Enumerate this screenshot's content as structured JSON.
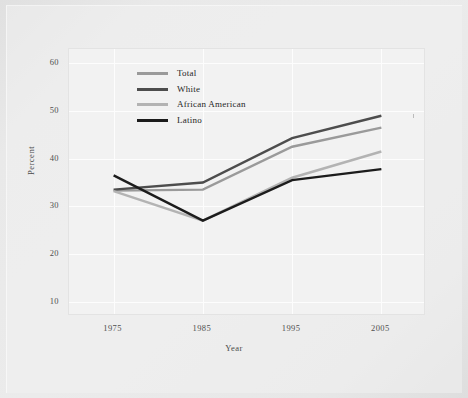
{
  "figure": {
    "background_color": "#e9e9e9",
    "plot_background_color": "#f2f2f2",
    "gridline_color": "#fdfdfd"
  },
  "chart_data": {
    "type": "line",
    "title": "",
    "subtitle": "",
    "xlabel": "Year",
    "ylabel": "Percent",
    "x": [
      1975,
      1985,
      1995,
      2005
    ],
    "xtick_labels": [
      "1975",
      "1985",
      "1995",
      "2005"
    ],
    "ytick_labels": [
      "10",
      "20",
      "30",
      "40",
      "50",
      "60"
    ],
    "yticks": [
      10,
      20,
      30,
      40,
      50,
      60
    ],
    "xlim": [
      1970,
      2010
    ],
    "ylim": [
      7,
      63
    ],
    "grid": true,
    "legend_position": "upper-left-inside",
    "series": [
      {
        "name": "Total",
        "color": "#9a9a9a",
        "width": 2.4,
        "values": [
          33.3,
          33.5,
          42.5,
          46.5
        ]
      },
      {
        "name": "White",
        "color": "#4d4d4d",
        "width": 2.4,
        "values": [
          33.5,
          35.0,
          44.3,
          49.0
        ]
      },
      {
        "name": "African American",
        "color": "#b3b3b3",
        "width": 2.4,
        "values": [
          33.2,
          27.0,
          36.0,
          41.5
        ]
      },
      {
        "name": "Latino",
        "color": "#1c1c1c",
        "width": 2.4,
        "values": [
          36.5,
          27.0,
          35.5,
          37.8
        ]
      }
    ]
  },
  "legend": {
    "items": [
      {
        "label": "Total",
        "color": "#9a9a9a"
      },
      {
        "label": "White",
        "color": "#4d4d4d"
      },
      {
        "label": "African American",
        "color": "#b3b3b3"
      },
      {
        "label": "Latino",
        "color": "#1c1c1c"
      }
    ]
  },
  "axes": {
    "y_axis_title": "Percent",
    "x_axis_title": "Year"
  }
}
